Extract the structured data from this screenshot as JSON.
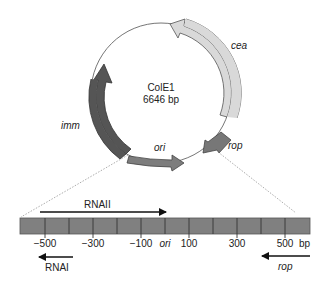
{
  "plasmid": {
    "name": "ColE1",
    "size": "6646 bp",
    "center": [
      161,
      93
    ],
    "radius": 70,
    "genes": [
      {
        "name": "cea",
        "color": "#d6d6d6",
        "label_pos": [
          237,
          46
        ]
      },
      {
        "name": "imm",
        "color": "#555555",
        "label_pos": [
          62,
          126
        ]
      },
      {
        "name": "ori",
        "color": "#7d7d7d",
        "label_pos": [
          160,
          150
        ]
      },
      {
        "name": "rop",
        "color": "#777777",
        "label_pos": [
          231,
          150
        ]
      }
    ]
  },
  "region": {
    "unit": "bp",
    "ticks": [
      {
        "label": "−500",
        "x": 45
      },
      {
        "label": "−300",
        "x": 93
      },
      {
        "label": "−100",
        "x": 141
      },
      {
        "label": "ori",
        "x": 165
      },
      {
        "label": "100",
        "x": 189
      },
      {
        "label": "300",
        "x": 237
      },
      {
        "label": "500",
        "x": 285
      }
    ],
    "bar_color": "#808080",
    "transcripts": [
      {
        "name": "RNAII",
        "direction": "right"
      },
      {
        "name": "RNAI",
        "direction": "left"
      },
      {
        "name": "rop",
        "direction": "left"
      }
    ]
  }
}
